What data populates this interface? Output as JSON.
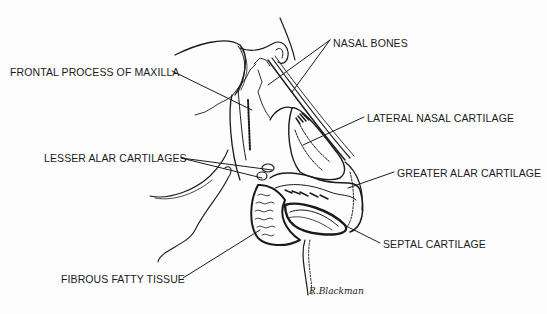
{
  "diagram": {
    "labels": [
      {
        "id": "nasal-bones",
        "text": "NASAL BONES",
        "x": 333,
        "y": 37
      },
      {
        "id": "frontal-process-maxilla",
        "text": "FRONTAL PROCESS OF MAXILLA",
        "x": 10,
        "y": 66
      },
      {
        "id": "lateral-nasal-cartilage",
        "text": "LATERAL NASAL CARTILAGE",
        "x": 367,
        "y": 112
      },
      {
        "id": "lesser-alar-cartilages",
        "text": "LESSER ALAR CARTILAGES",
        "x": 44,
        "y": 152
      },
      {
        "id": "greater-alar-cartilage",
        "text": "GREATER ALAR CARTILAGE",
        "x": 397,
        "y": 167
      },
      {
        "id": "septal-cartilage",
        "text": "SEPTAL CARTILAGE",
        "x": 383,
        "y": 238
      },
      {
        "id": "fibrous-fatty-tissue",
        "text": "FIBROUS FATTY TISSUE",
        "x": 61,
        "y": 273
      }
    ],
    "signature": "R.Blackman",
    "colors": {
      "ink": "#1a1a1a",
      "background": "#fdfdfd"
    }
  }
}
